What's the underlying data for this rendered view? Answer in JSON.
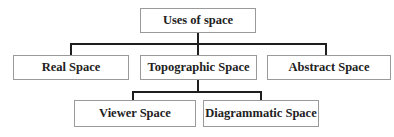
{
  "diagram": {
    "type": "hierarchy",
    "root": {
      "label": "Uses of space"
    },
    "level1": [
      {
        "label": "Real Space"
      },
      {
        "label": "Topographic Space"
      },
      {
        "label": "Abstract Space"
      }
    ],
    "level2_parent": "Topographic Space",
    "level2": [
      {
        "label": "Viewer Space"
      },
      {
        "label": "Diagrammatic Space"
      }
    ],
    "colors": {
      "connector": "#1e1e1e",
      "box_border": "#9a9a9a",
      "text": "#222222"
    }
  }
}
